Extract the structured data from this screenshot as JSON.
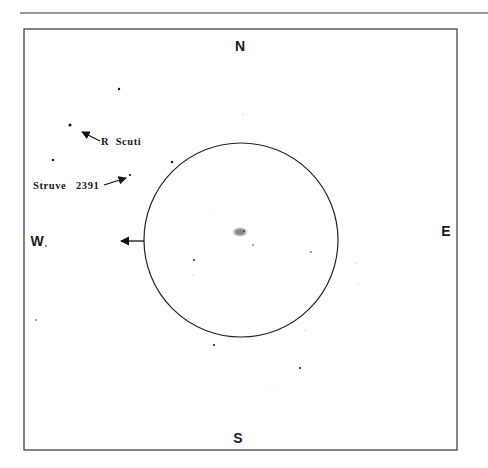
{
  "chart": {
    "type": "finder-chart",
    "compass": {
      "north": "N",
      "south": "S",
      "east": "E",
      "west": "W"
    },
    "eyepiece_field": {
      "cx": 241,
      "cy": 240,
      "r": 97
    },
    "motion_arrow": {
      "from": [
        144,
        241
      ],
      "to": [
        121,
        241
      ]
    },
    "labels": [
      {
        "text": "R  Scuti",
        "x": 101,
        "y": 145,
        "arrow_from": [
          100,
          141
        ],
        "arrow_to": [
          82,
          132
        ]
      },
      {
        "text": "Struve   2391",
        "x": 33,
        "y": 189,
        "arrow_from": [
          104,
          185
        ],
        "arrow_to": [
          126,
          178
        ]
      }
    ],
    "target": {
      "name": "nebulous-object",
      "x": 240,
      "y": 232
    },
    "stars": [
      {
        "x": 119,
        "y": 89,
        "r": 1.2
      },
      {
        "x": 70,
        "y": 125,
        "r": 1.5
      },
      {
        "x": 53,
        "y": 160,
        "r": 1.2
      },
      {
        "x": 130,
        "y": 175,
        "r": 1.1
      },
      {
        "x": 172,
        "y": 162,
        "r": 1.2
      },
      {
        "x": 46,
        "y": 246,
        "r": 0.8
      },
      {
        "x": 194,
        "y": 260,
        "r": 0.9
      },
      {
        "x": 253,
        "y": 245,
        "r": 0.7
      },
      {
        "x": 311,
        "y": 252,
        "r": 0.8
      },
      {
        "x": 214,
        "y": 345,
        "r": 1.0
      },
      {
        "x": 300,
        "y": 368,
        "r": 1.1
      },
      {
        "x": 36,
        "y": 320,
        "r": 0.7
      },
      {
        "x": 243,
        "y": 114,
        "r": 0.5
      },
      {
        "x": 356,
        "y": 263,
        "r": 0.5
      },
      {
        "x": 358,
        "y": 284,
        "r": 0.5
      },
      {
        "x": 193,
        "y": 275,
        "r": 0.5
      },
      {
        "x": 305,
        "y": 330,
        "r": 0.5
      },
      {
        "x": 272,
        "y": 390,
        "r": 0.4
      },
      {
        "x": 213,
        "y": 213,
        "r": 0.4
      },
      {
        "x": 126,
        "y": 149,
        "r": 0.4
      }
    ]
  }
}
